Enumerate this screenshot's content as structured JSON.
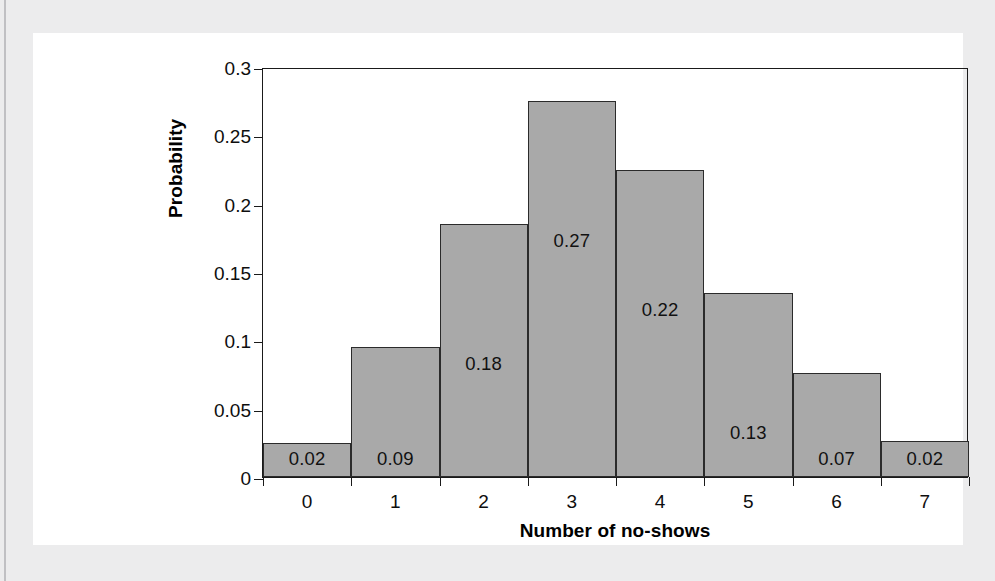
{
  "chart_data": {
    "type": "bar",
    "title": "",
    "subtitle": "",
    "xlabel": "Number of no-shows",
    "ylabel": "Probability",
    "categories": [
      "0",
      "1",
      "2",
      "3",
      "4",
      "5",
      "6",
      "7"
    ],
    "values": [
      0.025,
      0.095,
      0.185,
      0.275,
      0.225,
      0.135,
      0.076,
      0.026
    ],
    "data_labels": [
      "0.02",
      "0.09",
      "0.18",
      "0.27",
      "0.22",
      "0.13",
      "0.07",
      "0.02"
    ],
    "ylim": [
      0,
      0.3
    ],
    "ytick_values": [
      0,
      0.05,
      0.1,
      0.15,
      0.2,
      0.25,
      0.3
    ],
    "ytick_labels": [
      "0",
      "0.05",
      "0.1",
      "0.15",
      "0.2",
      "0.25",
      "0.3"
    ],
    "grid": false,
    "legend": null,
    "legend_position": "none",
    "bar_fill_color": "#a9a9a9",
    "bar_edge_color": "#2b2b2b",
    "axis_color": "#1a1a1a",
    "plot_background": "#ffffff",
    "page_background": "#ececed"
  }
}
